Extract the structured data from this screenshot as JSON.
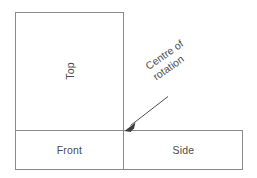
{
  "diagram": {
    "type": "orthographic-projection-layout",
    "canvas": {
      "width": 257,
      "height": 178,
      "background": "#ffffff"
    },
    "line_color": "#8a8a8a",
    "text_color": "#4a4a4a",
    "arrow_color": "#3f3f3f",
    "views": [
      {
        "key": "top",
        "label": "Top",
        "rotation_deg": -90,
        "rect": {
          "x": 15,
          "y": 12,
          "width": 109,
          "height": 119
        }
      },
      {
        "key": "front",
        "label": "Front",
        "rotation_deg": 0,
        "rect": {
          "x": 15,
          "y": 131,
          "width": 109,
          "height": 39
        }
      },
      {
        "key": "side",
        "label": "Side",
        "rotation_deg": 0,
        "rect": {
          "x": 124,
          "y": 131,
          "width": 119,
          "height": 39
        }
      }
    ],
    "annotation": {
      "key": "centre-of-rotation",
      "line1": "Centre of",
      "line2": "rotation",
      "rotation_deg": -35,
      "arrow": {
        "from": {
          "x": 168,
          "y": 97
        },
        "to": {
          "x": 125,
          "y": 130
        },
        "style": "solid-thin-with-filled-head"
      }
    }
  }
}
